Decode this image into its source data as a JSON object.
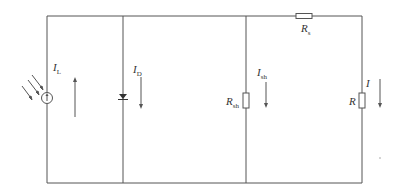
{
  "diagram": {
    "labels": {
      "IL": {
        "main": "I",
        "sub": "L"
      },
      "ID": {
        "main": "I",
        "sub": "D"
      },
      "Ish": {
        "main": "I",
        "sub": "sh"
      },
      "Rsh": {
        "main": "R",
        "sub": "sh"
      },
      "Rs": {
        "main": "R",
        "sub": "s"
      },
      "R": {
        "main": "R",
        "sub": ""
      },
      "I": {
        "main": "I",
        "sub": ""
      }
    },
    "components": [
      "current-source",
      "diode",
      "shunt-resistor",
      "series-resistor",
      "load-resistor"
    ],
    "colors": {
      "wire": "#555555",
      "text": "#333333"
    }
  }
}
